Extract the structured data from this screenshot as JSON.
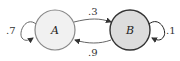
{
  "diagram": {
    "type": "markov-chain",
    "states": [
      {
        "id": "A",
        "label": "A",
        "fill": "#f1f1f1",
        "stroke": "#888888"
      },
      {
        "id": "B",
        "label": "B",
        "fill": "#dcdcdc",
        "stroke": "#333333"
      }
    ],
    "transitions": [
      {
        "from": "A",
        "to": "A",
        "label": ".7"
      },
      {
        "from": "A",
        "to": "B",
        "label": ".3"
      },
      {
        "from": "B",
        "to": "A",
        "label": ".9"
      },
      {
        "from": "B",
        "to": "B",
        "label": ".1"
      }
    ]
  }
}
